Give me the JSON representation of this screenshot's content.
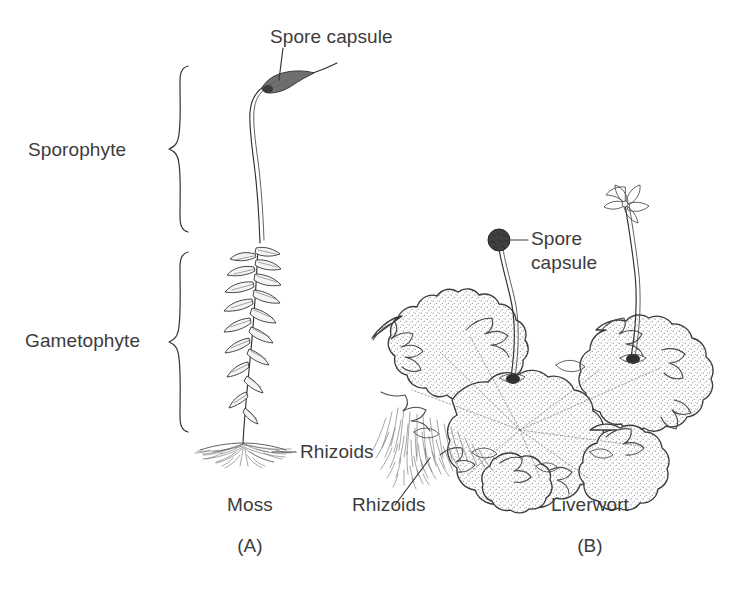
{
  "figure": {
    "title_hidden": "",
    "background_color": "#ffffff",
    "ink_color": "#2f2f2f",
    "text_color": "#3c3c3c"
  },
  "panels": [
    {
      "id": "A",
      "panel_letter": "(A)",
      "organism_label": "Moss",
      "labels": [
        {
          "key": "spore_capsule",
          "text": "Spore capsule"
        },
        {
          "key": "rhizoids",
          "text": "Rhizoids"
        }
      ],
      "brackets": [
        {
          "key": "sporophyte",
          "text": "Sporophyte"
        },
        {
          "key": "gametophyte",
          "text": "Gametophyte"
        }
      ]
    },
    {
      "id": "B",
      "panel_letter": "(B)",
      "organism_label": "Liverwort",
      "labels": [
        {
          "key": "spore_capsule_line1",
          "text": "Spore"
        },
        {
          "key": "spore_capsule_line2",
          "text": "capsule"
        },
        {
          "key": "rhizoids",
          "text": "Rhizoids"
        }
      ]
    }
  ],
  "moss": {
    "spore_capsule_label": "Spore capsule",
    "rhizoids_label": "Rhizoids",
    "sporophyte_label": "Sporophyte",
    "gametophyte_label": "Gametophyte",
    "name_label": "Moss",
    "panel_letter": "(A)"
  },
  "liverwort": {
    "spore_capsule_label_line1": "Spore",
    "spore_capsule_label_line2": "capsule",
    "rhizoids_label": "Rhizoids",
    "name_label": "Liverwort",
    "panel_letter": "(B)"
  }
}
